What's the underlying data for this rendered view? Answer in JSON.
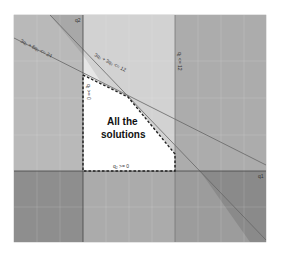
{
  "diagram": {
    "type": "linear-programming-feasible-region",
    "axes": {
      "x_label": "q1",
      "y_label": "q2",
      "x_ticks": [
        "-6",
        "-4",
        "-2",
        "2",
        "4",
        "6",
        "8",
        "10",
        "12",
        "14",
        "16",
        "18"
      ],
      "y_ticks": [
        "4",
        "2",
        "-2",
        "-4"
      ]
    },
    "constraints": [
      {
        "id": "c1",
        "label": "3q₁ + 6q₂ <= 24"
      },
      {
        "id": "c2",
        "label": "3q₁ + 3q₂ <= 12"
      },
      {
        "id": "c3",
        "label": "q₁ <= 12"
      },
      {
        "id": "c4",
        "label": "q₁ >= 0"
      },
      {
        "id": "c5",
        "label": "q₂ >= 0"
      }
    ],
    "region_label_line1": "All the",
    "region_label_line2": "solutions",
    "colors": {
      "background": "#ffffff",
      "light_gray": "#d9d9d9",
      "mid_gray": "#b8b8b8",
      "dark_gray": "#9a9a9a",
      "darker_gray": "#8a8a8a",
      "feasible": "#ffffff",
      "pale_band": "#e8e8e8",
      "line": "#555555",
      "dashed_boundary": "#222222"
    }
  }
}
